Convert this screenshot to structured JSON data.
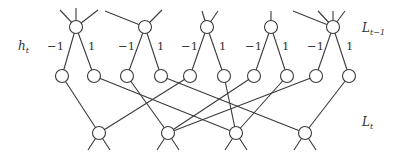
{
  "labels": {
    "hidden": {
      "main": "h",
      "sub": "t"
    },
    "layer_prev": {
      "main": "L",
      "sub": "t−1"
    },
    "layer_curr": {
      "main": "L",
      "sub": "t"
    }
  },
  "weights": {
    "neg": "−1",
    "pos": "1"
  },
  "colors": {
    "stroke": "#3a3a3a",
    "background": "#ffffff"
  },
  "node_radius": 6.5,
  "top_nodes": [
    {
      "id": "T1",
      "x": 76,
      "y": 27,
      "stubs": [
        [
          60,
          10
        ],
        [
          76,
          8
        ],
        [
          98,
          10
        ]
      ]
    },
    {
      "id": "T2",
      "x": 145,
      "y": 27,
      "stubs": [
        [
          105,
          11
        ],
        [
          162,
          10
        ]
      ]
    },
    {
      "id": "T3",
      "x": 207,
      "y": 27,
      "stubs": [
        [
          202,
          11
        ],
        [
          218,
          11
        ]
      ]
    },
    {
      "id": "T4",
      "x": 271,
      "y": 27,
      "stubs": [
        [
          271,
          11
        ]
      ]
    },
    {
      "id": "T5",
      "x": 333,
      "y": 27,
      "stubs": [
        [
          293,
          11
        ],
        [
          318,
          11
        ],
        [
          333,
          11
        ],
        [
          345,
          11
        ]
      ]
    }
  ],
  "mid_nodes": [
    {
      "id": "M1",
      "x": 62,
      "y": 76,
      "parent": "T1"
    },
    {
      "id": "M2",
      "x": 94,
      "y": 76,
      "parent": "T1"
    },
    {
      "id": "M3",
      "x": 127,
      "y": 76,
      "parent": "T2"
    },
    {
      "id": "M4",
      "x": 161,
      "y": 76,
      "parent": "T2"
    },
    {
      "id": "M5",
      "x": 190,
      "y": 76,
      "parent": "T3"
    },
    {
      "id": "M6",
      "x": 224,
      "y": 76,
      "parent": "T3"
    },
    {
      "id": "M7",
      "x": 254,
      "y": 76,
      "parent": "T4"
    },
    {
      "id": "M8",
      "x": 287,
      "y": 76,
      "parent": "T4"
    },
    {
      "id": "M9",
      "x": 316,
      "y": 76,
      "parent": "T5"
    },
    {
      "id": "M10",
      "x": 349,
      "y": 76,
      "parent": "T5"
    }
  ],
  "bottom_nodes": [
    {
      "id": "B1",
      "x": 99,
      "y": 133
    },
    {
      "id": "B2",
      "x": 168,
      "y": 133
    },
    {
      "id": "B3",
      "x": 236,
      "y": 133
    },
    {
      "id": "B4",
      "x": 305,
      "y": 133
    }
  ],
  "cross_edges": [
    [
      "M1",
      "B1"
    ],
    [
      "M2",
      "B3"
    ],
    [
      "M3",
      "B2"
    ],
    [
      "M4",
      "B4"
    ],
    [
      "M5",
      "B1"
    ],
    [
      "M6",
      "B3"
    ],
    [
      "M7",
      "B2"
    ],
    [
      "M8",
      "B3"
    ],
    [
      "M9",
      "B2"
    ],
    [
      "M10",
      "B4"
    ]
  ],
  "weight_labels": [
    {
      "text": "−1",
      "x": 47,
      "y": 41
    },
    {
      "text": "1",
      "x": 88,
      "y": 41
    },
    {
      "text": "−1",
      "x": 118,
      "y": 41
    },
    {
      "text": "1",
      "x": 157,
      "y": 41
    },
    {
      "text": "−1",
      "x": 181,
      "y": 41
    },
    {
      "text": "1",
      "x": 219,
      "y": 41
    },
    {
      "text": "−1",
      "x": 245,
      "y": 41
    },
    {
      "text": "1",
      "x": 282,
      "y": 41
    },
    {
      "text": "−1",
      "x": 307,
      "y": 41
    },
    {
      "text": "1",
      "x": 346,
      "y": 41
    }
  ]
}
